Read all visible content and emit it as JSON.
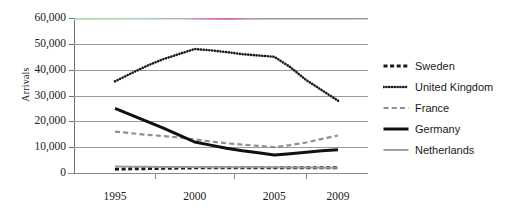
{
  "chart_data": {
    "type": "line",
    "title": "",
    "xlabel": "",
    "ylabel": "Arrivals",
    "x": [
      1995,
      1996,
      1997,
      1998,
      1999,
      2000,
      2001,
      2002,
      2003,
      2004,
      2005,
      2006,
      2007,
      2008,
      2009
    ],
    "xticklabels": [
      "1995",
      "2000",
      "2005",
      "2009"
    ],
    "yticklabels": [
      "60,000",
      "50,000",
      "40,000",
      "30,000",
      "20,000",
      "10,000",
      "0"
    ],
    "ytickvalues": [
      60000,
      50000,
      40000,
      30000,
      20000,
      10000,
      0
    ],
    "ylim": [
      0,
      60000
    ],
    "xlim": [
      1995,
      2009
    ],
    "grid": true,
    "legend_position": "right",
    "series": [
      {
        "name": "Sweden",
        "style": "thick-dashed",
        "color": "#1a1a1a",
        "values": [
          1500,
          1600,
          1700,
          1800,
          1900,
          2000,
          2000,
          2000,
          2000,
          2000,
          2000,
          2000,
          2000,
          2000,
          2000
        ]
      },
      {
        "name": "United Kingdom",
        "style": "dotted",
        "color": "#1a1a1a",
        "values": [
          35500,
          38500,
          41500,
          44000,
          46000,
          48000,
          47500,
          46800,
          46000,
          45500,
          45000,
          41000,
          36000,
          32000,
          28000
        ]
      },
      {
        "name": "France",
        "style": "gray-dashed",
        "color": "#8f8f8f",
        "values": [
          16000,
          15400,
          14800,
          14300,
          13800,
          13000,
          12200,
          11500,
          11000,
          10500,
          10000,
          10800,
          11800,
          13200,
          14500
        ]
      },
      {
        "name": "Germany",
        "style": "thick-solid",
        "color": "#111111",
        "values": [
          25000,
          22500,
          20000,
          17500,
          14800,
          12000,
          10800,
          9600,
          8600,
          7800,
          7000,
          7500,
          8000,
          8600,
          9000
        ]
      },
      {
        "name": "Netherlands",
        "style": "gray-solid",
        "color": "#9a9a9a",
        "values": [
          2500,
          2450,
          2400,
          2350,
          2300,
          2300,
          2250,
          2250,
          2200,
          2200,
          2200,
          2150,
          2100,
          2050,
          2000
        ]
      }
    ]
  },
  "legend": {
    "items": [
      {
        "label": "Sweden",
        "swatch": "thick-dashed-swatch"
      },
      {
        "label": "United Kingdom",
        "swatch": "dotted-swatch"
      },
      {
        "label": "France",
        "swatch": "gray-dashed-swatch"
      },
      {
        "label": "Germany",
        "swatch": "thick-solid-swatch"
      },
      {
        "label": "Netherlands",
        "swatch": "gray-solid-swatch"
      }
    ]
  },
  "colors": {
    "axis": "#8a8a8a",
    "gridline": "#9a9a9a",
    "text": "#1a1a1a",
    "series_dark": "#1a1a1a",
    "series_gray": "#9a9a9a"
  }
}
